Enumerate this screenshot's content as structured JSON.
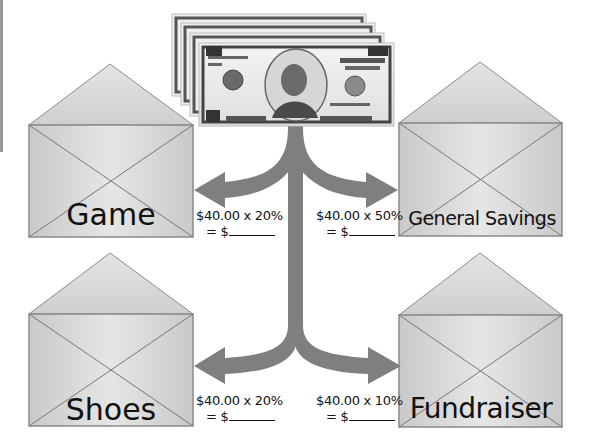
{
  "total": "$40.00",
  "bill": {
    "denomination": "10",
    "top_text": "THE UNITED STATES OF AMERICA",
    "bottom_left": "TEN",
    "bottom_right": "DOLLARS",
    "serial": "GL 33481444 A",
    "count": 4
  },
  "envelopes": [
    {
      "label": "Game",
      "calc_line1": "$40.00 x 20%",
      "calc_line2": "= $",
      "position": "top-left"
    },
    {
      "label": "General Savings",
      "calc_line1": "$40.00 x 50%",
      "calc_line2": "= $",
      "position": "top-right"
    },
    {
      "label": "Shoes",
      "calc_line1": "$40.00 x 20%",
      "calc_line2": "= $",
      "position": "bottom-left"
    },
    {
      "label": "Fundraiser",
      "calc_line1": "$40.00 x 10%",
      "calc_line2": "= $",
      "position": "bottom-right"
    }
  ],
  "colors": {
    "arrow": "#7f7f7f",
    "envelope_fill": "#d4d4d4",
    "envelope_stroke": "#8a8a8a",
    "text": "#111111"
  }
}
